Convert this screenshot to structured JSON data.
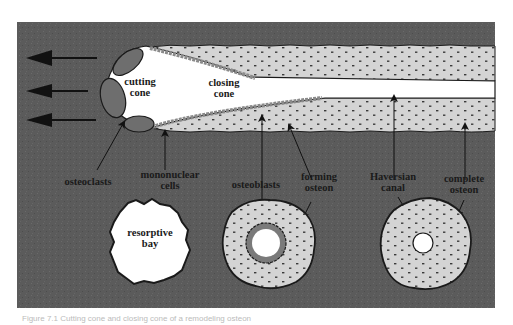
{
  "diagram": {
    "colors": {
      "background": "#5b5b5b",
      "lamellar_bone": "#d4d4d4",
      "canal": "#ffffff",
      "cells": "#7a7a7a",
      "outline": "#1a1a1a",
      "page": "#ffffff"
    },
    "direction_arrows": {
      "count": 3,
      "meaning": "direction of cutting cone advance (leftward)"
    },
    "longitudinal_section": {
      "labels": {
        "cutting_cone_line1": "cutting",
        "cutting_cone_line2": "cone",
        "closing_cone_line1": "closing",
        "closing_cone_line2": "cone"
      }
    },
    "pointer_labels": {
      "osteoclasts": "osteoclasts",
      "mononuclear_line1": "mononuclear",
      "mononuclear_line2": "cells",
      "osteoblasts": "osteoblasts",
      "forming_line1": "forming",
      "forming_line2": "osteon",
      "haversian_line1": "Haversian",
      "haversian_line2": "canal",
      "complete_line1": "complete",
      "complete_line2": "osteon"
    },
    "cross_sections": [
      {
        "name": "resorptive bay",
        "line1": "resorptive",
        "line2": "bay"
      },
      {
        "name": "forming osteon"
      },
      {
        "name": "complete osteon"
      }
    ]
  },
  "caption": {
    "text": "Figure 7.1   Cutting cone and closing cone of a remodeling osteon"
  }
}
